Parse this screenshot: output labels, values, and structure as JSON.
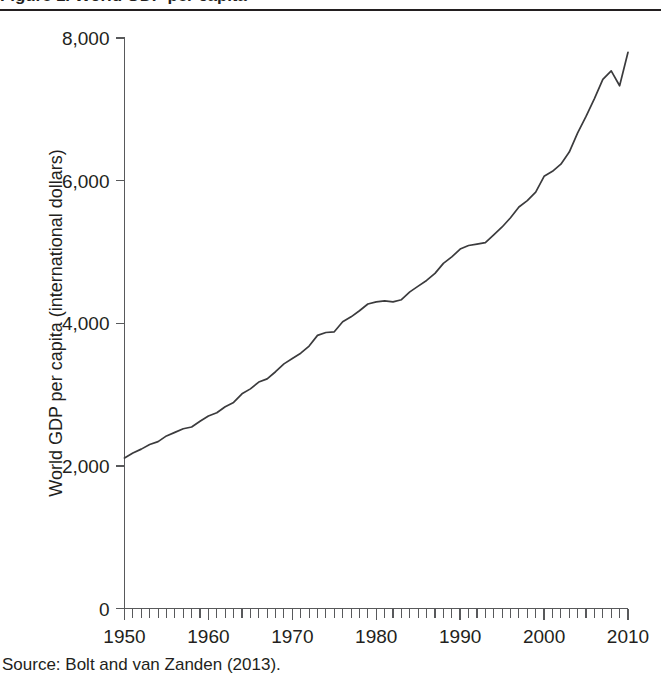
{
  "figure": {
    "title": "Figure 1. World GDP per capita",
    "source_note": "Source: Bolt and van Zanden (2013)."
  },
  "chart_data": {
    "type": "line",
    "title": "Figure 1. World GDP per capita",
    "xlabel": "",
    "ylabel": "World GDP per capita (international dollars)",
    "xlim": [
      1950,
      2010
    ],
    "ylim": [
      0,
      8000
    ],
    "grid": false,
    "legend": null,
    "x_ticks_major": [
      1950,
      1960,
      1970,
      1980,
      1990,
      2000,
      2010
    ],
    "x_tick_labels": [
      "1950",
      "1960",
      "1970",
      "1980",
      "1990",
      "2000",
      "2010"
    ],
    "x_minor_tick_interval": 1,
    "y_ticks": [
      0,
      2000,
      4000,
      6000,
      8000
    ],
    "y_tick_labels": [
      "0",
      "2,000",
      "4,000",
      "6,000",
      "8,000"
    ],
    "series": [
      {
        "name": "World GDP per capita",
        "color": "#3b3b3d",
        "x": [
          1950,
          1951,
          1952,
          1953,
          1954,
          1955,
          1956,
          1957,
          1958,
          1959,
          1960,
          1961,
          1962,
          1963,
          1964,
          1965,
          1966,
          1967,
          1968,
          1969,
          1970,
          1971,
          1972,
          1973,
          1974,
          1975,
          1976,
          1977,
          1978,
          1979,
          1980,
          1981,
          1982,
          1983,
          1984,
          1985,
          1986,
          1987,
          1988,
          1989,
          1990,
          1991,
          1992,
          1993,
          1994,
          1995,
          1996,
          1997,
          1998,
          1999,
          2000,
          2001,
          2002,
          2003,
          2004,
          2005,
          2006,
          2007,
          2008,
          2009,
          2010
        ],
        "values": [
          2110,
          2180,
          2235,
          2300,
          2340,
          2420,
          2470,
          2520,
          2545,
          2625,
          2700,
          2745,
          2830,
          2890,
          3010,
          3080,
          3175,
          3220,
          3320,
          3430,
          3505,
          3580,
          3680,
          3830,
          3870,
          3880,
          4020,
          4090,
          4175,
          4270,
          4300,
          4315,
          4300,
          4330,
          4440,
          4520,
          4600,
          4700,
          4840,
          4930,
          5040,
          5090,
          5110,
          5130,
          5240,
          5350,
          5480,
          5630,
          5720,
          5840,
          6060,
          6130,
          6230,
          6400,
          6670,
          6900,
          7150,
          7420,
          7540,
          7330,
          7800
        ]
      }
    ],
    "annotations": [
      {
        "label": "1974-75 oil shock plateau",
        "x": 1975,
        "y": 3880
      },
      {
        "label": "1980-83 recession plateau",
        "x": 1982,
        "y": 4300
      },
      {
        "label": "1990-93 slowdown plateau",
        "x": 1992,
        "y": 5110
      },
      {
        "label": "2009 financial crisis dip",
        "x": 2009,
        "y": 7330
      }
    ]
  },
  "colors": {
    "line": "#3b3b3d",
    "axis": "#58595b",
    "text": "#231f20",
    "background": "#ffffff"
  }
}
